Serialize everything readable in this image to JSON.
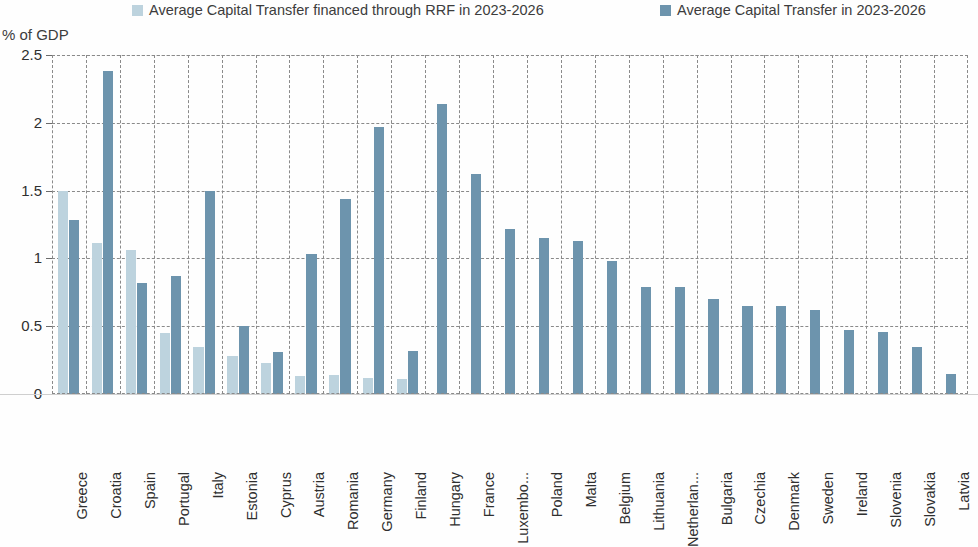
{
  "axis_title": "% of GDP",
  "legend": [
    {
      "name": "rrf",
      "label": "Average  Capital Transfer financed through RRF in 2023-2026",
      "color": "#bdd3de"
    },
    {
      "name": "total",
      "label": "Average Capital Transfer in 2023-2026",
      "color": "#6d94ad"
    }
  ],
  "colors": {
    "series_rrf": "#bdd3de",
    "series_total": "#6d94ad",
    "grid": "#8a8a8a",
    "text": "#2f2f2f",
    "background": "#fefefe"
  },
  "chart_data": {
    "type": "bar",
    "title": "",
    "subtitle": "",
    "xlabel": "",
    "ylabel": "% of GDP",
    "ylim": [
      0,
      2.5
    ],
    "yticks": [
      "0",
      "0.5",
      "1",
      "1.5",
      "2",
      "2.5"
    ],
    "ytick_values": [
      0,
      0.5,
      1,
      1.5,
      2,
      2.5
    ],
    "grid": true,
    "legend_position": "top",
    "categories": [
      "Greece",
      "Croatia",
      "Spain",
      "Portugal",
      "Italy",
      "Estonia",
      "Cyprus",
      "Austria",
      "Romania",
      "Germany",
      "Finland",
      "Hungary",
      "France",
      "Luxembo...",
      "Poland",
      "Malta",
      "Belgium",
      "Lithuania",
      "Netherlan...",
      "Bulgaria",
      "Czechia",
      "Denmark",
      "Sweden",
      "Ireland",
      "Slovenia",
      "Slovakia",
      "Latvia"
    ],
    "series": [
      {
        "name": "Average  Capital Transfer financed through RRF in 2023-2026",
        "key": "rrf",
        "color": "#bdd3de",
        "values": [
          1.5,
          1.11,
          1.06,
          0.45,
          0.35,
          0.28,
          0.23,
          0.13,
          0.14,
          0.12,
          0.11,
          null,
          null,
          null,
          null,
          null,
          null,
          null,
          null,
          null,
          null,
          null,
          null,
          null,
          null,
          null,
          null
        ]
      },
      {
        "name": "Average Capital Transfer in 2023-2026",
        "key": "total",
        "color": "#6d94ad",
        "values": [
          1.28,
          2.38,
          0.82,
          0.87,
          1.5,
          0.5,
          0.31,
          1.03,
          1.44,
          1.97,
          0.32,
          2.14,
          1.62,
          1.22,
          1.15,
          1.13,
          0.98,
          0.79,
          0.79,
          0.7,
          0.65,
          0.65,
          0.62,
          0.47,
          0.46,
          0.35,
          0.15
        ]
      }
    ]
  }
}
